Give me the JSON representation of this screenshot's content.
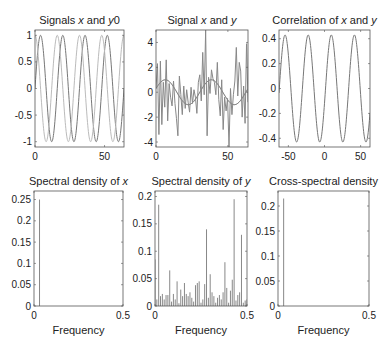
{
  "chart_data": [
    {
      "id": "p1",
      "type": "line",
      "title": "Signals x and y0",
      "title_parts": [
        {
          "t": "Signals "
        },
        {
          "t": "x",
          "i": true
        },
        {
          "t": " and "
        },
        {
          "t": "y",
          "i": true
        },
        {
          "t": "0"
        }
      ],
      "xlabel": "",
      "ylabel": "",
      "xlim": [
        0,
        64
      ],
      "ylim": [
        -1.1,
        1.1
      ],
      "xticks": [
        0,
        50
      ],
      "yticks": [
        -1,
        -0.5,
        0,
        0.5,
        1
      ],
      "box": {
        "x0": 35,
        "x1": 124,
        "y0": 30,
        "y1": 147
      },
      "series": [
        {
          "name": "x",
          "func": "sin",
          "amp": 1,
          "period": 16,
          "phase": 0.0,
          "color": "#777777"
        },
        {
          "name": "y0",
          "func": "sin",
          "amp": 1,
          "period": 16,
          "phase": 1.5708,
          "color": "#bbbbbb"
        }
      ]
    },
    {
      "id": "p2",
      "type": "line",
      "title": "Signal x and y",
      "title_parts": [
        {
          "t": "Signal "
        },
        {
          "t": "x",
          "i": true
        },
        {
          "t": " and "
        },
        {
          "t": "y",
          "i": true
        }
      ],
      "xlim": [
        0,
        64
      ],
      "ylim": [
        -4.4,
        5
      ],
      "xticks": [
        0,
        50
      ],
      "yticks": [
        -4,
        -2,
        0,
        2,
        4
      ],
      "box": {
        "x0": 156,
        "x1": 248,
        "y0": 30,
        "y1": 147
      },
      "series": [
        {
          "name": "x",
          "func": "sin",
          "amp": 1,
          "period": 32,
          "phase": 0.3,
          "color": "#555555"
        },
        {
          "name": "y",
          "type": "noisy",
          "color": "#888888",
          "values": [
            0.3,
            2.3,
            -3.4,
            2.5,
            -2.6,
            0.8,
            -1.2,
            2.6,
            -2.3,
            0.7,
            -0.4,
            -1.1,
            0.9,
            -0.9,
            -2.1,
            -3.5,
            1.3,
            -0.2,
            -1.8,
            0.5,
            -1.3,
            0.2,
            -0.8,
            -1.6,
            0.4,
            -0.9,
            0.2,
            -0.4,
            -1.7,
            0.8,
            1.4,
            -0.7,
            3.2,
            -0.2,
            5.0,
            -3.5,
            1.2,
            -0.1,
            1.8,
            1.1,
            0.8,
            -0.2,
            2.4,
            -0.6,
            -1.9,
            1.0,
            -3.0,
            -0.4,
            -1.5,
            -0.5,
            -4.4,
            0.3,
            -1.8,
            -0.2,
            0.9,
            3.6,
            -0.3,
            2.4,
            1.7,
            -2.0,
            0.5,
            -2.5,
            3.9,
            -0.8
          ]
        }
      ]
    },
    {
      "id": "p3",
      "type": "line",
      "title": "Correlation of x and y",
      "title_parts": [
        {
          "t": "Correlation of "
        },
        {
          "t": "x",
          "i": true
        },
        {
          "t": " and "
        },
        {
          "t": "y",
          "i": true
        }
      ],
      "xlim": [
        -63,
        63
      ],
      "ylim": [
        -0.47,
        0.47
      ],
      "xticks": [
        -50,
        0,
        50
      ],
      "yticks": [
        -0.4,
        -0.2,
        0,
        0.2,
        0.4
      ],
      "box": {
        "x0": 279,
        "x1": 370,
        "y0": 30,
        "y1": 147
      },
      "series": [
        {
          "name": "xcorr",
          "func": "cos",
          "amp": 0.43,
          "period": 32,
          "phase": -1.85,
          "color": "#777777"
        }
      ]
    },
    {
      "id": "p4",
      "type": "bar",
      "title": "Spectral density of x",
      "title_parts": [
        {
          "t": "Spectral density of "
        },
        {
          "t": "x",
          "i": true
        }
      ],
      "xlabel": "Frequency",
      "xlim": [
        0,
        0.5
      ],
      "ylim": [
        0,
        0.27
      ],
      "xticks": [
        0,
        0.5
      ],
      "yticks": [
        0,
        0.05,
        0.1,
        0.15,
        0.2,
        0.25
      ],
      "box": {
        "x0": 34,
        "x1": 123,
        "y0": 191,
        "y1": 306
      },
      "bars": [
        {
          "x": 0.031,
          "y": 0.25
        }
      ],
      "color": "#888888"
    },
    {
      "id": "p5",
      "type": "bar",
      "title": "Spectral density of y",
      "title_parts": [
        {
          "t": "Spectral density of "
        },
        {
          "t": "y",
          "i": true
        }
      ],
      "xlabel": "Frequency",
      "xlim": [
        0,
        0.5
      ],
      "ylim": [
        0,
        0.21
      ],
      "xticks": [
        0,
        0.5
      ],
      "yticks": [
        0,
        0.05,
        0.1,
        0.15,
        0.2
      ],
      "box": {
        "x0": 155,
        "x1": 247,
        "y0": 191,
        "y1": 306
      },
      "bars_y": [
        0.085,
        0.012,
        0.185,
        0.018,
        0.022,
        0.012,
        0.02,
        0.02,
        0.065,
        0.008,
        0.022,
        0.012,
        0.045,
        0.005,
        0.03,
        0.018,
        0.042,
        0.022,
        0.018,
        0.025,
        0.015,
        0.008,
        0.038,
        0.042,
        0.045,
        0.006,
        0.012,
        0.04,
        0.14,
        0.015,
        0.058,
        0.025,
        0.018,
        0.006,
        0.015,
        0.02,
        0.012,
        0.025,
        0.08,
        0.033,
        0.006,
        0.028,
        0.048,
        0.195,
        0.01,
        0.02,
        0.025,
        0.13,
        0.006,
        0.01,
        0.012
      ],
      "color": "#888888"
    },
    {
      "id": "p6",
      "type": "bar",
      "title": "Cross-spectral density",
      "title_parts": [
        {
          "t": "Cross-spectral density"
        }
      ],
      "xlabel": "Frequency",
      "xlim": [
        0,
        0.5
      ],
      "ylim": [
        0,
        0.23
      ],
      "xticks": [
        0,
        0.5
      ],
      "yticks": [
        0,
        0.05,
        0.1,
        0.15,
        0.2
      ],
      "box": {
        "x0": 278,
        "x1": 369,
        "y0": 191,
        "y1": 306
      },
      "bars": [
        {
          "x": 0.031,
          "y": 0.215
        }
      ],
      "color": "#888888"
    }
  ]
}
